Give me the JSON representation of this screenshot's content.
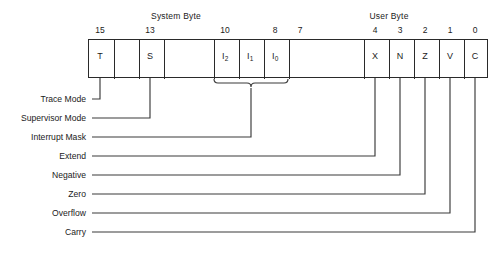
{
  "figure": {
    "groups": [
      {
        "id": "system-byte",
        "label": "System Byte",
        "center_x": 176
      },
      {
        "id": "user-byte",
        "label": "User Byte",
        "center_x": 389
      }
    ],
    "register": {
      "left": 88,
      "top": 39,
      "width": 400,
      "height": 39,
      "bit_count": 16,
      "dividers_x": [
        113,
        138,
        163,
        213,
        238,
        263,
        288,
        363,
        388,
        413,
        438,
        463
      ]
    },
    "bits": [
      {
        "number": "15",
        "symbol": "T",
        "sub": "",
        "center_x": 100,
        "labeled": true,
        "has_cell_text": true
      },
      {
        "number": "",
        "symbol": "",
        "sub": "",
        "center_x": 125,
        "labeled": false,
        "has_cell_text": false
      },
      {
        "number": "13",
        "symbol": "S",
        "sub": "",
        "center_x": 150,
        "labeled": true,
        "has_cell_text": true
      },
      {
        "number": "",
        "symbol": "",
        "sub": "",
        "center_x": 188,
        "labeled": false,
        "has_cell_text": false
      },
      {
        "number": "10",
        "symbol": "I",
        "sub": "2",
        "center_x": 225,
        "labeled": true,
        "has_cell_text": true
      },
      {
        "number": "",
        "symbol": "I",
        "sub": "1",
        "center_x": 250,
        "labeled": false,
        "has_cell_text": true
      },
      {
        "number": "8",
        "symbol": "I",
        "sub": "0",
        "center_x": 275,
        "labeled": true,
        "has_cell_text": true
      },
      {
        "number": "7",
        "symbol": "",
        "sub": "",
        "center_x": 300,
        "labeled": true,
        "has_cell_text": false
      },
      {
        "number": "4",
        "symbol": "X",
        "sub": "",
        "center_x": 375,
        "labeled": true,
        "has_cell_text": true
      },
      {
        "number": "3",
        "symbol": "N",
        "sub": "",
        "center_x": 400,
        "labeled": true,
        "has_cell_text": true
      },
      {
        "number": "2",
        "symbol": "Z",
        "sub": "",
        "center_x": 425,
        "labeled": true,
        "has_cell_text": true
      },
      {
        "number": "1",
        "symbol": "V",
        "sub": "",
        "center_x": 450,
        "labeled": true,
        "has_cell_text": true
      },
      {
        "number": "0",
        "symbol": "C",
        "sub": "",
        "center_x": 475,
        "labeled": true,
        "has_cell_text": true
      }
    ],
    "flags": [
      {
        "id": "trace-mode",
        "label": "Trace Mode",
        "bit": "15",
        "symbol": "T",
        "line_y": 99,
        "source_x": 100
      },
      {
        "id": "supervisor-mode",
        "label": "Supervisor Mode",
        "bit": "13",
        "symbol": "S",
        "line_y": 118,
        "source_x": 150
      },
      {
        "id": "interrupt-mask",
        "label": "Interrupt Mask",
        "bit": "10-8",
        "symbol": "I2 I1 I0",
        "line_y": 137,
        "source_x": 251
      },
      {
        "id": "extend",
        "label": "Extend",
        "bit": "4",
        "symbol": "X",
        "line_y": 156,
        "source_x": 375
      },
      {
        "id": "negative",
        "label": "Negative",
        "bit": "3",
        "symbol": "N",
        "line_y": 175,
        "source_x": 400
      },
      {
        "id": "zero",
        "label": "Zero",
        "bit": "2",
        "symbol": "Z",
        "line_y": 194,
        "source_x": 425
      },
      {
        "id": "overflow",
        "label": "Overflow",
        "bit": "1",
        "symbol": "V",
        "line_y": 213,
        "source_x": 450
      },
      {
        "id": "carry",
        "label": "Carry",
        "bit": "0",
        "symbol": "C",
        "line_y": 232,
        "source_x": 475
      }
    ],
    "brace": {
      "label": "interrupt-mask-brace",
      "left_x": 214,
      "right_x": 288,
      "stem_x": 251,
      "top_y": 84
    },
    "label_right_edge_x": 86,
    "colors": {
      "background": "#ffffff",
      "line": "#3a3a3a",
      "box_border": "#2a2a2a",
      "text": "#1b1b1b"
    }
  }
}
